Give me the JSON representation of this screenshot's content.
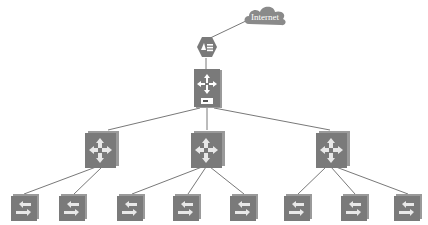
{
  "diagram": {
    "type": "network-topology",
    "colors": {
      "device_fill": "#7a7a7a",
      "device_shadow": "#9a9a9a",
      "link": "#555555",
      "cloud": "#8a8a8a",
      "background": "#ffffff"
    },
    "nodes": [
      {
        "id": "internet",
        "kind": "cloud",
        "label": "Internet",
        "x": 244,
        "y": 4
      },
      {
        "id": "firewall",
        "kind": "firewall",
        "icon": "firewall-icon",
        "x": 196,
        "y": 36
      },
      {
        "id": "core",
        "kind": "core-switch",
        "icon": "core-switch-icon",
        "x": 193,
        "y": 68
      },
      {
        "id": "dist1",
        "kind": "distribution-switch",
        "icon": "switch-icon",
        "x": 84,
        "y": 130
      },
      {
        "id": "dist2",
        "kind": "distribution-switch",
        "icon": "switch-icon",
        "x": 190,
        "y": 130
      },
      {
        "id": "dist3",
        "kind": "distribution-switch",
        "icon": "switch-icon",
        "x": 315,
        "y": 130
      },
      {
        "id": "acc1",
        "kind": "access-switch",
        "icon": "access-switch-icon",
        "x": 10,
        "y": 193
      },
      {
        "id": "acc2",
        "kind": "access-switch",
        "icon": "access-switch-icon",
        "x": 58,
        "y": 193
      },
      {
        "id": "acc3",
        "kind": "access-switch",
        "icon": "access-switch-icon",
        "x": 116,
        "y": 193
      },
      {
        "id": "acc4",
        "kind": "access-switch",
        "icon": "access-switch-icon",
        "x": 172,
        "y": 193
      },
      {
        "id": "acc5",
        "kind": "access-switch",
        "icon": "access-switch-icon",
        "x": 229,
        "y": 193
      },
      {
        "id": "acc6",
        "kind": "access-switch",
        "icon": "access-switch-icon",
        "x": 283,
        "y": 193
      },
      {
        "id": "acc7",
        "kind": "access-switch",
        "icon": "access-switch-icon",
        "x": 340,
        "y": 193
      },
      {
        "id": "acc8",
        "kind": "access-switch",
        "icon": "access-switch-icon",
        "x": 393,
        "y": 193
      }
    ],
    "links": [
      [
        "internet",
        "firewall"
      ],
      [
        "firewall",
        "core"
      ],
      [
        "core",
        "dist1"
      ],
      [
        "core",
        "dist2"
      ],
      [
        "core",
        "dist3"
      ],
      [
        "dist1",
        "acc1"
      ],
      [
        "dist1",
        "acc2"
      ],
      [
        "dist2",
        "acc3"
      ],
      [
        "dist2",
        "acc4"
      ],
      [
        "dist2",
        "acc5"
      ],
      [
        "dist3",
        "acc6"
      ],
      [
        "dist3",
        "acc7"
      ],
      [
        "dist3",
        "acc8"
      ]
    ]
  },
  "labels": {
    "internet": "Internet"
  }
}
